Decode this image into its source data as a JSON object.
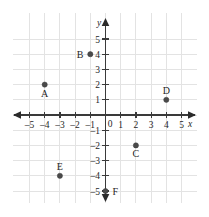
{
  "chart_data": {
    "type": "scatter",
    "title": "",
    "xlabel": "x",
    "ylabel": "y",
    "xlim": [
      -5.5,
      5.5
    ],
    "ylim": [
      -5.5,
      5.5
    ],
    "grid": true,
    "legend": "none",
    "x_ticks": [
      -5,
      -4,
      -3,
      -2,
      -1,
      1,
      2,
      3,
      4,
      5
    ],
    "y_ticks": [
      5,
      4,
      3,
      2,
      1,
      -1,
      -2,
      -3,
      -4,
      -5
    ],
    "x_tick_labels": [
      "–5",
      "–4",
      "–3",
      "–2",
      "–1",
      "1",
      "2",
      "3",
      "4",
      "5"
    ],
    "y_tick_labels": [
      "5",
      "4",
      "3",
      "2",
      "1",
      "–1",
      "–2",
      "–3",
      "–4",
      "–5"
    ],
    "origin_label": "0",
    "marker_color": "#4a4a4a",
    "axis_color": "#3a3a3a",
    "grid_color": "#e3e3e3",
    "points": [
      {
        "label": "A",
        "x": -4,
        "y": 2,
        "label_position": "below"
      },
      {
        "label": "B",
        "x": -1,
        "y": 4,
        "label_position": "left"
      },
      {
        "label": "C",
        "x": 2,
        "y": -2,
        "label_position": "below"
      },
      {
        "label": "D",
        "x": 4,
        "y": 1,
        "label_position": "above"
      },
      {
        "label": "E",
        "x": -3,
        "y": -4,
        "label_position": "above"
      },
      {
        "label": "F",
        "x": 0,
        "y": -5,
        "label_position": "right"
      }
    ]
  }
}
